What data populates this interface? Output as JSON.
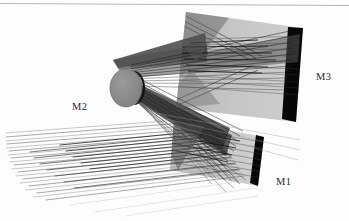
{
  "figure": {
    "type": "optical-ray-trace-diagram",
    "background_color": "#fdfdfd",
    "border": {
      "top_rule_color": "#b4b4b4",
      "top_rule_y": 4
    },
    "labels": {
      "m1": "M1",
      "m2": "M2",
      "m3": "M3"
    },
    "label_color": "#2a2a2a",
    "components": [
      {
        "name": "M1",
        "kind": "flat-mirror-panel",
        "shape": "parallelogram",
        "face_color": "#c9c9c9",
        "edge_band_color": "#080808",
        "label": "M1",
        "position": "lower-right"
      },
      {
        "name": "M2",
        "kind": "convex-disc-mirror",
        "shape": "ellipse",
        "face_color": "#8c8c8c",
        "edge_band_color": "#101010",
        "label": "M2",
        "position": "center-left"
      },
      {
        "name": "M3",
        "kind": "flat-mirror-panel",
        "shape": "quadrilateral",
        "face_color": "#c4c4c4",
        "edge_band_color": "#060606",
        "label": "M3",
        "position": "upper-right"
      }
    ],
    "ray_bundles": [
      {
        "name": "incoming-beam",
        "from": "left-edge",
        "to": "M1",
        "color": "#8f8f8f",
        "density": "sparse"
      },
      {
        "name": "m1-to-m2-beam",
        "from": "M1",
        "to": "M2",
        "color": "#3a3a3a",
        "density": "dense"
      },
      {
        "name": "m2-to-m3-beam",
        "from": "M2",
        "to": "M3",
        "color": "#2e2e2e",
        "density": "dense"
      },
      {
        "name": "m3-fan",
        "from": "M3",
        "to": "exit",
        "color": "#555555",
        "density": "medium"
      }
    ]
  }
}
